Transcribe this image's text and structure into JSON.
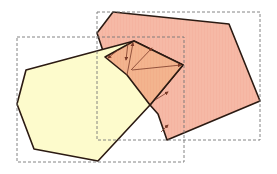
{
  "diagram": {
    "colors": {
      "background": "#ffffff",
      "polygon_a_fill": "#fdfbcc",
      "polygon_b_fill": "#f6b9a6",
      "overlap_fill": "#f2b48e",
      "edge_stroke": "#2b1a12",
      "bbox_stroke": "#777777",
      "arrow_stroke": "#7a3a28"
    },
    "polygon_a": {
      "label": "yellow polygon",
      "points": "26,70 134,41 183,65 150,105 98,161 34,149 17,104"
    },
    "polygon_b": {
      "label": "red polygon",
      "points": "113,12 229,24 260,101 167,140 158,114 150,105 127,75 105,57 97,33"
    },
    "overlap": {
      "label": "intersection region",
      "points": "105,57 134,41 183,65 150,105 127,75"
    },
    "bbox_a": {
      "label": "bounding box A",
      "x": 17,
      "y": 37,
      "w": 167,
      "h": 125
    },
    "bbox_b": {
      "label": "bounding box B",
      "x": 97,
      "y": 12,
      "w": 163,
      "h": 128
    },
    "arrows": [
      {
        "x1": 118,
        "y1": 50,
        "x2": 108,
        "y2": 58
      },
      {
        "x1": 128,
        "y1": 43,
        "x2": 126,
        "y2": 60
      },
      {
        "x1": 127,
        "y1": 75,
        "x2": 133,
        "y2": 43
      },
      {
        "x1": 131,
        "y1": 70,
        "x2": 152,
        "y2": 48
      },
      {
        "x1": 132,
        "y1": 70,
        "x2": 181,
        "y2": 65
      },
      {
        "x1": 155,
        "y1": 100,
        "x2": 168,
        "y2": 92
      },
      {
        "x1": 161,
        "y1": 132,
        "x2": 168,
        "y2": 125
      }
    ]
  }
}
